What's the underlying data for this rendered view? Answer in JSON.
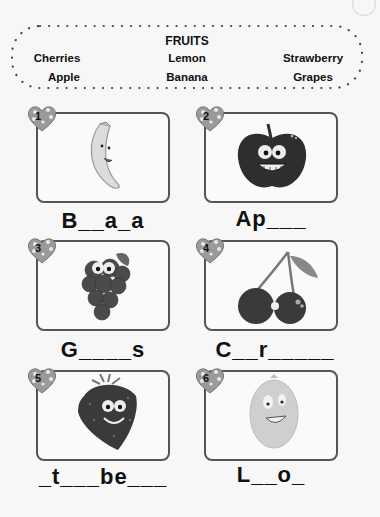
{
  "worksheet": {
    "word_bank": {
      "title": "FRUITS",
      "words": [
        "Cherries",
        "Lemon",
        "Strawberry",
        "Apple",
        "Banana",
        "Grapes"
      ]
    },
    "items": [
      {
        "number": "1",
        "picture": "banana-picture",
        "word": "B__a_a"
      },
      {
        "number": "2",
        "picture": "apple-picture",
        "word": "Ap___"
      },
      {
        "number": "3",
        "picture": "grapes-picture",
        "word": "G____s"
      },
      {
        "number": "4",
        "picture": "cherries-picture",
        "word": "C__r_____"
      },
      {
        "number": "5",
        "picture": "strawberry-picture",
        "word": "_t___be___"
      },
      {
        "number": "6",
        "picture": "lemon-picture",
        "word": "L__o_"
      }
    ]
  }
}
